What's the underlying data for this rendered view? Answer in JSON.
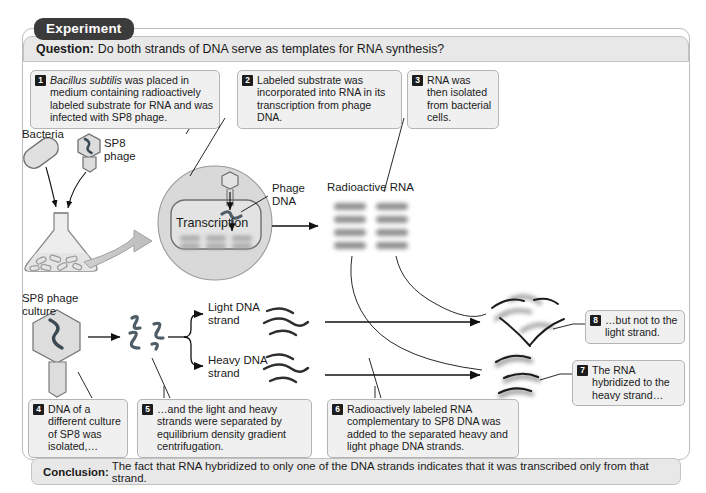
{
  "figure": {
    "tab_label": "Experiment",
    "question_prefix": "Question:",
    "question_text": "Do both strands of DNA serve as templates for RNA synthesis?",
    "conclusion_prefix": "Conclusion:",
    "conclusion_text": "The fact that RNA hybridized to only one of the DNA strands indicates that it was transcribed only from that strand."
  },
  "callouts": [
    {
      "num": "1",
      "text": "Bacillus subtilis was placed in medium containing radioactively labeled substrate for RNA and was infected with SP8 phage.",
      "italic_lead": "Bacillus subtilis",
      "rest": " was placed in medium containing radioactively labeled substrate for RNA and was infected with SP8 phage."
    },
    {
      "num": "2",
      "text": "Labeled substrate was incorporated into RNA in its transcription from phage DNA."
    },
    {
      "num": "3",
      "text": "RNA was then isolated from bacterial cells."
    },
    {
      "num": "4",
      "text": "DNA of a different culture of SP8 was isolated,…"
    },
    {
      "num": "5",
      "text": "…and the light and heavy strands were separated by equilibrium density gradient centrifugation."
    },
    {
      "num": "6",
      "text": "Radioactively labeled RNA complementary to SP8 DNA was added to the separated heavy and light  phage DNA strands."
    },
    {
      "num": "7",
      "text": "The RNA hybridized to the heavy strand…"
    },
    {
      "num": "8",
      "text": "…but not to the light strand."
    }
  ],
  "labels": {
    "bacteria": "Bacteria",
    "sp8_phage": "SP8\nphage",
    "transcription": "Transcription",
    "phage_dna": "Phage\nDNA",
    "radioactive_rna": "Radioactive RNA",
    "sp8_phage_culture": "SP8 phage\nculture",
    "light_dna_strand": "Light DNA\nstrand",
    "heavy_dna_strand": "Heavy DNA\nstrand"
  },
  "colors": {
    "tab_bg": "#3b3b3b",
    "bar_bg": "#e8e8e8",
    "callout_bg": "#f0f0f0",
    "frame_border": "#bdbdbd",
    "ink": "#1a1a1a",
    "cell_fill": "#d7d7d7",
    "organelle_fill": "#e3e3e3",
    "flask_fill": "#ededed",
    "dna_stroke": "#5a6a72"
  }
}
